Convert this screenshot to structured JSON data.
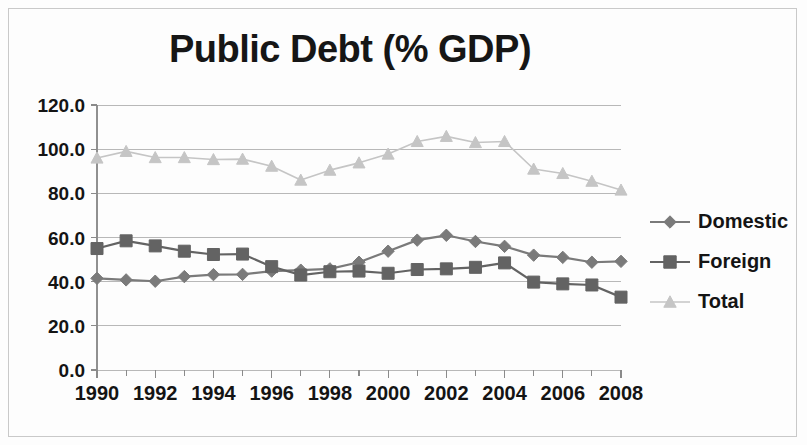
{
  "chart_data": {
    "type": "line",
    "title": "Public Debt (% GDP)",
    "xlabel": "",
    "ylabel": "",
    "x": [
      1990,
      1991,
      1992,
      1993,
      1994,
      1995,
      1996,
      1997,
      1998,
      1999,
      2000,
      2001,
      2002,
      2003,
      2004,
      2005,
      2006,
      2007,
      2008
    ],
    "xtick_labels": [
      "1990",
      "1992",
      "1994",
      "1996",
      "1998",
      "2000",
      "2002",
      "2004",
      "2006",
      "2008"
    ],
    "xtick_values": [
      1990,
      1992,
      1994,
      1996,
      1998,
      2000,
      2002,
      2004,
      2006,
      2008
    ],
    "ytick_labels": [
      "0.0",
      "20.0",
      "40.0",
      "60.0",
      "80.0",
      "100.0",
      "120.0"
    ],
    "ytick_values": [
      0,
      20,
      40,
      60,
      80,
      100,
      120
    ],
    "ylim": [
      0,
      120
    ],
    "xlim": [
      1990,
      2008
    ],
    "grid": true,
    "legend_position": "right",
    "series": [
      {
        "name": "Domestic",
        "marker": "diamond",
        "color": "#7a7a7a",
        "values": [
          41.5,
          40.8,
          40.2,
          42.3,
          43.2,
          43.3,
          44.8,
          45.2,
          45.8,
          48.8,
          53.8,
          58.8,
          61.0,
          58.2,
          56.0,
          52.0,
          51.0,
          48.8,
          49.2
        ]
      },
      {
        "name": "Foreign",
        "marker": "square",
        "color": "#636363",
        "values": [
          55.0,
          58.5,
          56.2,
          53.8,
          52.3,
          52.5,
          46.8,
          43.0,
          44.5,
          44.8,
          43.8,
          45.5,
          45.8,
          46.5,
          48.5,
          39.8,
          39.0,
          38.5,
          33.0
        ]
      },
      {
        "name": "Total",
        "marker": "triangle",
        "color": "#c5c5c5",
        "values": [
          96.0,
          99.0,
          96.2,
          96.2,
          95.3,
          95.5,
          92.3,
          86.0,
          90.5,
          93.8,
          97.8,
          103.5,
          105.8,
          103.0,
          103.5,
          91.0,
          89.0,
          85.5,
          81.5
        ]
      }
    ]
  },
  "legend": {
    "items": [
      {
        "label": "Domestic",
        "marker": "diamond-marker",
        "color": "#7a7a7a"
      },
      {
        "label": "Foreign",
        "marker": "square-marker",
        "color": "#636363"
      },
      {
        "label": "Total",
        "marker": "triangle-marker",
        "color": "#c5c5c5"
      }
    ]
  },
  "colors": {
    "domestic": "#7a7a7a",
    "foreign": "#636363",
    "total": "#c5c5c5",
    "gridline": "#b8b8b8",
    "axis": "#909090",
    "text": "#141414",
    "border": "#c9c9c9",
    "background": "#fdfdfd"
  }
}
